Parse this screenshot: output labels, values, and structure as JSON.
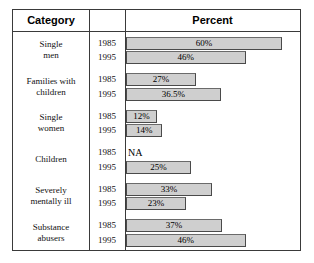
{
  "header": {
    "category_label": "Category",
    "mid_label": "",
    "percent_label": "Percent"
  },
  "chart_data": {
    "type": "bar",
    "title": "Percent",
    "xlabel": "Percent",
    "ylabel": "Category",
    "orientation": "horizontal",
    "xlim": [
      0,
      65
    ],
    "grid": false,
    "legend": "none",
    "categories": [
      "Single men",
      "Families with children",
      "Single women",
      "Children",
      "Severely mentally ill",
      "Substance abusers"
    ],
    "series": [
      {
        "name": "1985",
        "values": [
          60,
          27,
          12,
          null,
          33,
          37
        ]
      },
      {
        "name": "1995",
        "values": [
          46,
          36.5,
          14,
          25,
          23,
          46
        ]
      }
    ],
    "annotations": [
      "NA for Children 1985"
    ]
  },
  "rows": [
    {
      "category_line1": "Single",
      "category_line2": "men",
      "entries": [
        {
          "year": "1985",
          "value": 60,
          "label": "60%",
          "na": false
        },
        {
          "year": "1995",
          "value": 46,
          "label": "46%",
          "na": false
        }
      ]
    },
    {
      "category_line1": "Families with",
      "category_line2": "children",
      "entries": [
        {
          "year": "1985",
          "value": 27,
          "label": "27%",
          "na": false
        },
        {
          "year": "1995",
          "value": 36.5,
          "label": "36.5%",
          "na": false
        }
      ]
    },
    {
      "category_line1": "Single",
      "category_line2": "women",
      "entries": [
        {
          "year": "1985",
          "value": 12,
          "label": "12%",
          "na": false
        },
        {
          "year": "1995",
          "value": 14,
          "label": "14%",
          "na": false
        }
      ]
    },
    {
      "category_line1": "Children",
      "category_line2": "",
      "entries": [
        {
          "year": "1985",
          "value": null,
          "label": "NA",
          "na": true
        },
        {
          "year": "1995",
          "value": 25,
          "label": "25%",
          "na": false
        }
      ]
    },
    {
      "category_line1": "Severely",
      "category_line2": "mentally ill",
      "entries": [
        {
          "year": "1985",
          "value": 33,
          "label": "33%",
          "na": false
        },
        {
          "year": "1995",
          "value": 23,
          "label": "23%",
          "na": false
        }
      ]
    },
    {
      "category_line1": "Substance",
      "category_line2": "abusers",
      "entries": [
        {
          "year": "1985",
          "value": 37,
          "label": "37%",
          "na": false
        },
        {
          "year": "1995",
          "value": 46,
          "label": "46%",
          "na": false
        }
      ]
    }
  ],
  "style": {
    "bar_fill": "#cfcfcf",
    "bar_border": "#4a4a4a",
    "frame_color": "#3a3a3a",
    "background": "#ffffff",
    "px_per_percent": 2.6
  }
}
